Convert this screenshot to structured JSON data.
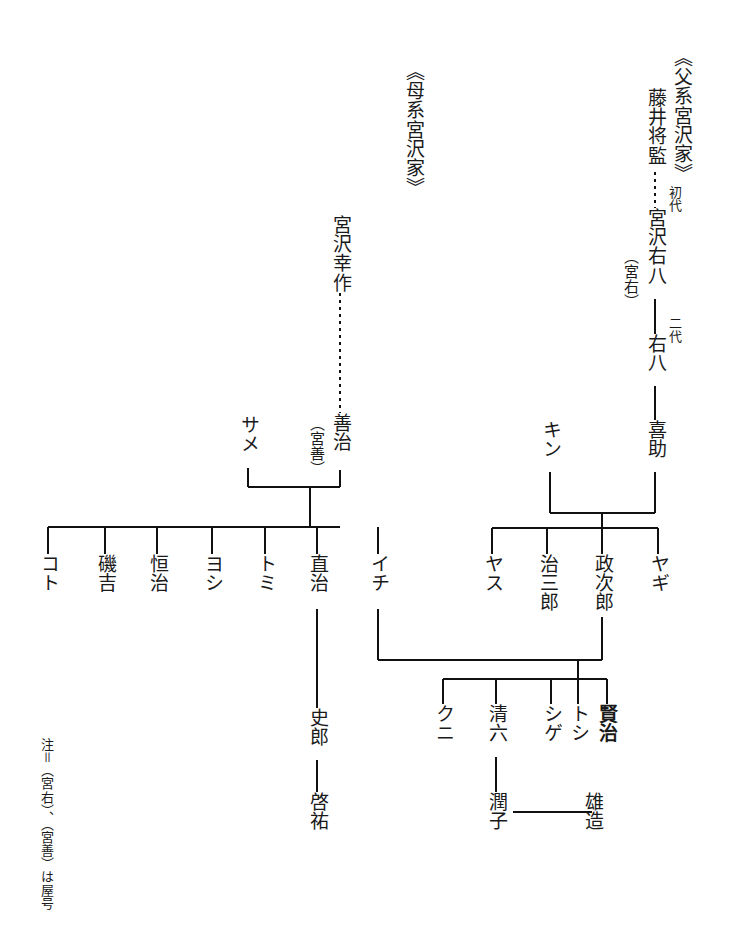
{
  "document": {
    "type": "genealogy-chart",
    "subject": "宮沢賢治 family tree",
    "note": "注＝（宮右）、（宮善）は屋号"
  },
  "headings": {
    "paternal": "《父系宮沢家》",
    "maternal": "《母系宮沢家》"
  },
  "generation_labels": {
    "first": "初代",
    "second": "二代"
  },
  "paternal": {
    "ancestor": "藤井将監",
    "founder": "宮沢右八",
    "founder_yago": "（宮右）",
    "second_gen": "右八",
    "third_gen": "喜助",
    "spouse": "キン",
    "children": [
      "ヤス",
      "治三郎",
      "政次郎",
      "ヤギ"
    ]
  },
  "maternal": {
    "ancestor": "宮沢幸作",
    "head": "善治",
    "head_yago": "（宮善）",
    "spouse": "サメ",
    "children": [
      "コト",
      "磯吉",
      "恒治",
      "ヨシ",
      "トミ",
      "直治",
      "イチ"
    ],
    "naoji_line": {
      "child": "史郎",
      "grandchild": "啓祐"
    }
  },
  "kenji_generation": {
    "parents": [
      "イチ",
      "政次郎"
    ],
    "children": [
      "クニ",
      "清六",
      "シゲ",
      "トシ",
      "賢治"
    ],
    "seiroku_child": "潤子",
    "junko_spouse": "雄造"
  },
  "colors": {
    "ink": "#111111",
    "background": "#ffffff"
  }
}
